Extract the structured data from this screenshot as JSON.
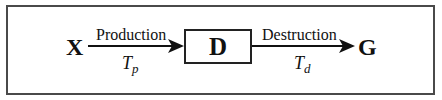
{
  "diagram": {
    "type": "flow",
    "nodes": {
      "source": "X",
      "middle": "D",
      "target": "G"
    },
    "edges": [
      {
        "from": "X",
        "to": "D",
        "label": "Production",
        "rate_symbol": "T",
        "rate_subscript": "p"
      },
      {
        "from": "D",
        "to": "G",
        "label": "Destruction",
        "rate_symbol": "T",
        "rate_subscript": "d"
      }
    ],
    "colors": {
      "frame": "#4a4a4a",
      "stroke": "#111111",
      "background": "#ffffff"
    }
  }
}
